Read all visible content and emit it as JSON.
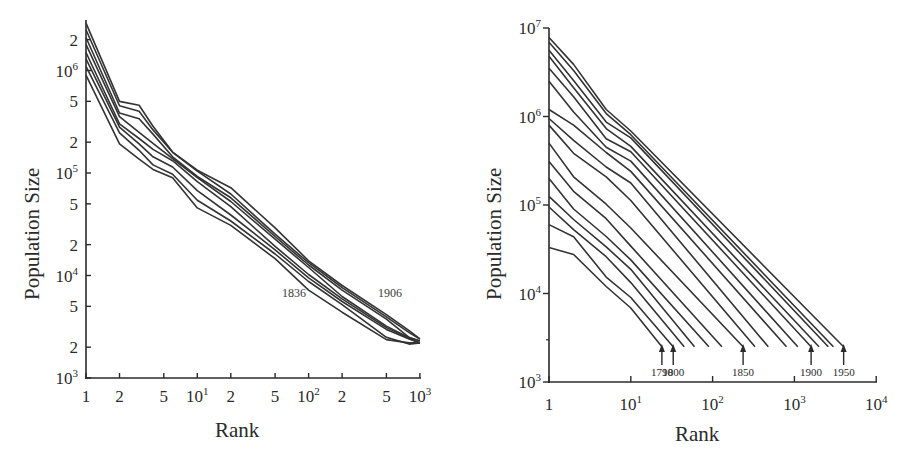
{
  "chart_data": [
    {
      "type": "line",
      "title": "",
      "xlabel": "Rank",
      "ylabel": "Population Size",
      "xscale": "log",
      "yscale": "log",
      "xlim": [
        1,
        1000
      ],
      "ylim": [
        1000,
        3000000
      ],
      "grid": false,
      "legend": "none",
      "x_tick_labels": [
        "1",
        "2",
        "5",
        "10^1",
        "2",
        "5",
        "10^2",
        "2",
        "5",
        "10^3"
      ],
      "y_tick_labels": [
        "10^3",
        "2",
        "5",
        "10^4",
        "2",
        "5",
        "10^5",
        "2",
        "5",
        "10^6",
        "2"
      ],
      "annotations": [
        "1836",
        "1906"
      ],
      "x": [
        1,
        2,
        3,
        4,
        6,
        10,
        20,
        50,
        100,
        200,
        500,
        800,
        1000
      ],
      "series": [
        {
          "name": "1836",
          "values": [
            900000,
            200000,
            140000,
            110000,
            90000,
            45000,
            30000,
            14000,
            7500,
            4500,
            2400,
            2200,
            2200
          ]
        },
        {
          "name": "1846",
          "values": [
            1100000,
            240000,
            160000,
            125000,
            100000,
            55000,
            34000,
            16000,
            8500,
            5000,
            2600,
            2200,
            2200
          ]
        },
        {
          "name": "1856",
          "values": [
            1300000,
            280000,
            190000,
            140000,
            110000,
            70000,
            40000,
            18000,
            9500,
            5500,
            2900,
            2300,
            2200
          ]
        },
        {
          "name": "1866",
          "values": [
            1500000,
            310000,
            220000,
            170000,
            130000,
            80000,
            45000,
            20000,
            10500,
            6000,
            3100,
            2400,
            2200
          ]
        },
        {
          "name": "1876",
          "values": [
            1800000,
            340000,
            260000,
            200000,
            140000,
            90000,
            52000,
            22000,
            11500,
            6500,
            3300,
            2500,
            2300
          ]
        },
        {
          "name": "1886",
          "values": [
            2100000,
            380000,
            330000,
            230000,
            150000,
            95000,
            58000,
            24000,
            12500,
            7000,
            3600,
            2600,
            2300
          ]
        },
        {
          "name": "1896",
          "values": [
            2500000,
            460000,
            400000,
            260000,
            155000,
            100000,
            65000,
            26000,
            13500,
            7600,
            3900,
            2700,
            2400
          ]
        },
        {
          "name": "1906",
          "values": [
            2900000,
            520000,
            470000,
            290000,
            160000,
            105000,
            70000,
            28000,
            14500,
            8200,
            4200,
            2900,
            2400
          ]
        }
      ]
    },
    {
      "type": "line",
      "title": "",
      "xlabel": "Rank",
      "ylabel": "Population Size",
      "xscale": "log",
      "yscale": "log",
      "xlim": [
        1,
        10000
      ],
      "ylim": [
        1000,
        10000000
      ],
      "grid": false,
      "legend": "none",
      "x_tick_labels": [
        "1",
        "10^1",
        "10^2",
        "10^3",
        "10^4"
      ],
      "y_tick_labels": [
        "10^3",
        "10^4",
        "10^5",
        "10^6",
        "10^7"
      ],
      "annotations": [
        {
          "label": "1790",
          "x": 24
        },
        {
          "label": "1800",
          "x": 33
        },
        {
          "label": "1850",
          "x": 236
        },
        {
          "label": "1900",
          "x": 1600
        },
        {
          "label": "1950",
          "x": 4000
        }
      ],
      "series_endpoints_rank": [
        24,
        33,
        45,
        60,
        90,
        130,
        236,
        330,
        480,
        800,
        1100,
        1600,
        2000,
        2600,
        3000,
        4000
      ],
      "series": [
        {
          "name": "1790",
          "values_at": {
            "1": 33000,
            "2": 27000,
            "5": 12000,
            "10": 7000,
            "24": 2500
          }
        },
        {
          "name": "1800",
          "values_at": {
            "1": 60000,
            "2": 42000,
            "5": 15000,
            "10": 9000,
            "33": 2500
          }
        },
        {
          "name": "1810",
          "values_at": {
            "1": 95000,
            "2": 55000,
            "5": 25000,
            "10": 13000,
            "45": 2500
          }
        },
        {
          "name": "1820",
          "values_at": {
            "1": 125000,
            "2": 70000,
            "5": 35000,
            "10": 18000,
            "60": 2500
          }
        },
        {
          "name": "1830",
          "values_at": {
            "1": 200000,
            "2": 90000,
            "5": 45000,
            "10": 25000,
            "90": 2500
          }
        },
        {
          "name": "1840",
          "values_at": {
            "1": 310000,
            "2": 140000,
            "5": 70000,
            "10": 35000,
            "130": 2500
          }
        },
        {
          "name": "1850",
          "values_at": {
            "1": 500000,
            "2": 200000,
            "5": 100000,
            "10": 55000,
            "236": 2500
          }
        },
        {
          "name": "1860",
          "values_at": {
            "1": 800000,
            "2": 400000,
            "5": 200000,
            "10": 110000,
            "330": 2500
          }
        },
        {
          "name": "1870",
          "values_at": {
            "1": 950000,
            "2": 550000,
            "5": 280000,
            "10": 170000,
            "480": 2500
          }
        },
        {
          "name": "1880",
          "values_at": {
            "1": 1200000,
            "2": 800000,
            "5": 400000,
            "10": 250000,
            "800": 2500
          }
        },
        {
          "name": "1890",
          "values_at": {
            "1": 2500000,
            "2": 1100000,
            "5": 450000,
            "10": 320000,
            "1100": 2500
          }
        },
        {
          "name": "1900",
          "values_at": {
            "1": 3500000,
            "2": 1600000,
            "5": 550000,
            "10": 400000,
            "1600": 2500
          }
        },
        {
          "name": "1910",
          "values_at": {
            "1": 4800000,
            "2": 2200000,
            "5": 700000,
            "10": 450000,
            "2000": 2500
          }
        },
        {
          "name": "1920",
          "values_at": {
            "1": 5600000,
            "2": 2600000,
            "5": 900000,
            "10": 550000,
            "2600": 2500
          }
        },
        {
          "name": "1930",
          "values_at": {
            "1": 6900000,
            "2": 3300000,
            "5": 1100000,
            "10": 650000,
            "3000": 2500
          }
        },
        {
          "name": "1950",
          "values_at": {
            "1": 7800000,
            "2": 3800000,
            "5": 1200000,
            "10": 700000,
            "4000": 2500
          }
        }
      ]
    }
  ],
  "left_chart": {
    "ylabel": "Population Size",
    "xlabel": "Rank",
    "annot_a": "1836",
    "annot_b": "1906",
    "x_ticks": [
      {
        "label": "1",
        "sup": ""
      },
      {
        "label": "2",
        "sup": ""
      },
      {
        "label": "5",
        "sup": ""
      },
      {
        "label": "10",
        "sup": "1"
      },
      {
        "label": "2",
        "sup": ""
      },
      {
        "label": "5",
        "sup": ""
      },
      {
        "label": "10",
        "sup": "2"
      },
      {
        "label": "2",
        "sup": ""
      },
      {
        "label": "5",
        "sup": ""
      },
      {
        "label": "10",
        "sup": "3"
      }
    ],
    "y_ticks": [
      {
        "label": "10",
        "sup": "3"
      },
      {
        "label": "2",
        "sup": ""
      },
      {
        "label": "5",
        "sup": ""
      },
      {
        "label": "10",
        "sup": "4"
      },
      {
        "label": "2",
        "sup": ""
      },
      {
        "label": "5",
        "sup": ""
      },
      {
        "label": "10",
        "sup": "5"
      },
      {
        "label": "2",
        "sup": ""
      },
      {
        "label": "5",
        "sup": ""
      },
      {
        "label": "10",
        "sup": "6"
      },
      {
        "label": "2",
        "sup": ""
      }
    ]
  },
  "right_chart": {
    "ylabel": "Population Size",
    "xlabel": "Rank",
    "x_ticks": [
      {
        "label": "1",
        "sup": ""
      },
      {
        "label": "10",
        "sup": "1"
      },
      {
        "label": "10",
        "sup": "2"
      },
      {
        "label": "10",
        "sup": "3"
      },
      {
        "label": "10",
        "sup": "4"
      }
    ],
    "y_ticks": [
      {
        "label": "10",
        "sup": "3"
      },
      {
        "label": "10",
        "sup": "4"
      },
      {
        "label": "10",
        "sup": "5"
      },
      {
        "label": "10",
        "sup": "6"
      },
      {
        "label": "10",
        "sup": "7"
      }
    ],
    "arrows": [
      {
        "label": "1790"
      },
      {
        "label": "1800"
      },
      {
        "label": "1850"
      },
      {
        "label": "1900"
      },
      {
        "label": "1950"
      }
    ]
  }
}
